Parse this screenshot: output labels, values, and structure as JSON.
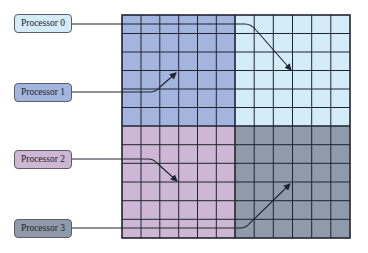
{
  "diagram": {
    "type": "domain-decomposition",
    "grid": {
      "x": 122,
      "y": 15,
      "width": 228,
      "height": 223,
      "cols": 12,
      "rows": 12,
      "line_color": "#1e2430",
      "quadrants": [
        {
          "id": 0,
          "color": "#d4ecf7",
          "position": "top-right"
        },
        {
          "id": 1,
          "color": "#a3b5de",
          "position": "top-left"
        },
        {
          "id": 2,
          "color": "#cdb7d4",
          "position": "bottom-left"
        },
        {
          "id": 3,
          "color": "#8f9aab",
          "position": "bottom-right"
        }
      ]
    },
    "processors": [
      {
        "label": "Processor 0",
        "fill": "#d4ecf7",
        "box_y": 11,
        "line_y": 24,
        "target": "top-right"
      },
      {
        "label": "Processor 1",
        "fill": "#a3b5de",
        "box_y": 83,
        "line_y": 92,
        "target": "top-left"
      },
      {
        "label": "Processor 2",
        "fill": "#cdb7d4",
        "box_y": 150,
        "line_y": 159,
        "target": "bottom-left"
      },
      {
        "label": "Processor 3",
        "fill": "#8f9aab",
        "box_y": 219,
        "line_y": 228,
        "target": "bottom-right"
      }
    ]
  }
}
